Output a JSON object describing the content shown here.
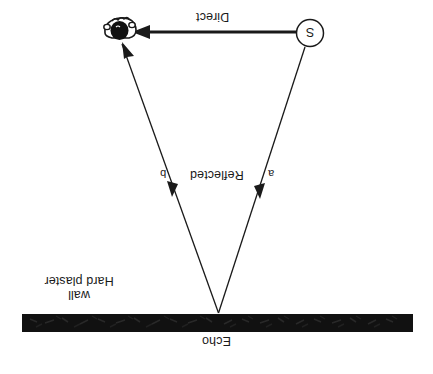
{
  "diagram": {
    "background": "#ffffff",
    "ink": "#1a1a1a",
    "wall_color": "#111111",
    "labels": {
      "direct": "Direct",
      "reflected": "Reflected",
      "path_a": "a",
      "path_b": "b",
      "echo": "Echo",
      "wall_line1": "Hard plaster",
      "wall_line2": "wall",
      "source": "S"
    },
    "nodes": {
      "source": {
        "name": "sound-source",
        "label": "S",
        "cx": 310,
        "cy": 33,
        "r": 14
      },
      "listener": {
        "name": "listener-head",
        "cx": 120,
        "cy": 32
      },
      "reflection_point": {
        "name": "reflection-point",
        "x": 218,
        "y": 314
      }
    },
    "wall": {
      "x": 22,
      "y": 314,
      "width": 391,
      "height": 18
    },
    "rays": [
      {
        "name": "direct-ray",
        "label": "Direct",
        "from": [
          296,
          32
        ],
        "to": [
          136,
          32
        ],
        "weight": "thick"
      },
      {
        "name": "reflected-ray-a",
        "label": "a",
        "from": [
          305,
          47
        ],
        "to": [
          218,
          314
        ],
        "weight": "thin"
      },
      {
        "name": "reflected-ray-b",
        "label": "b",
        "from": [
          218,
          314
        ],
        "to": [
          123,
          45
        ],
        "weight": "thin"
      }
    ],
    "orientation": "rotated-180"
  }
}
